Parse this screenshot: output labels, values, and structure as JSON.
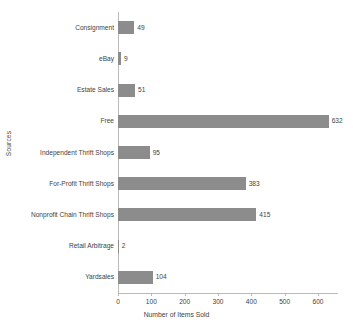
{
  "chart_data": {
    "type": "bar",
    "orientation": "horizontal",
    "title": "",
    "xlabel": "Number of Items Sold",
    "ylabel": "Sources",
    "categories": [
      "Consignment",
      "eBay",
      "Estate Sales",
      "Free",
      "Independent Thrift Shops",
      "For-Profit Thrift Shops",
      "Nonprofit Chain Thrift Shops",
      "Retail Arbitrage",
      "Yardsales"
    ],
    "values": [
      49,
      9,
      51,
      632,
      95,
      383,
      415,
      2,
      104
    ],
    "xlim": [
      0,
      660
    ],
    "xticks": [
      0,
      100,
      200,
      300,
      400,
      500,
      600
    ],
    "grid": false,
    "legend": false,
    "bar_color": "#8c8c8c",
    "axis_color": "#b9b9b9",
    "background": "#ffffff"
  }
}
